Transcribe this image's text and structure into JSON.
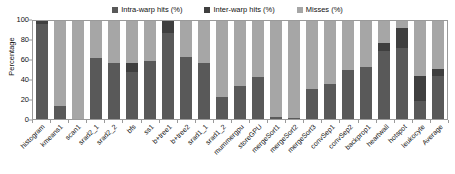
{
  "chart_data": {
    "type": "bar",
    "subtype": "stacked-column",
    "title": "",
    "xlabel": "",
    "ylabel": "Percentage",
    "ylim": [
      0,
      100
    ],
    "yticks": [
      0,
      20,
      40,
      60,
      80,
      100
    ],
    "grid": false,
    "legend_position": "top-center",
    "categories": [
      "histogram",
      "kmeans1",
      "scan1",
      "srad2_1",
      "srad2_2",
      "bfs",
      "ss1",
      "b+tree1",
      "b+tree2",
      "srad1_1",
      "srad1_2",
      "mummergpu",
      "storeGPU",
      "mergeSort1",
      "mergeSort2",
      "mergeSort3",
      "convSep1",
      "convSep2",
      "backprop1",
      "heartwall",
      "hotspot",
      "leukocyte",
      "Average"
    ],
    "series": [
      {
        "name": "Intra-warp hits (%)",
        "color": "#595959",
        "values": [
          97,
          13,
          0,
          62,
          57,
          48,
          59,
          88,
          63,
          57,
          22,
          34,
          43,
          2,
          1,
          31,
          36,
          50,
          53,
          69,
          72,
          18,
          44
        ]
      },
      {
        "name": "Inter-warp hits (%)",
        "color": "#3f3f3f",
        "values": [
          3,
          0,
          0,
          0,
          0,
          9,
          0,
          12,
          0,
          0,
          0,
          0,
          0,
          0,
          0,
          0,
          0,
          0,
          0,
          9,
          21,
          26,
          7
        ]
      },
      {
        "name": "Misses (%)",
        "color": "#a6a6a6",
        "values": [
          0,
          87,
          100,
          38,
          43,
          43,
          41,
          0,
          37,
          43,
          78,
          66,
          57,
          98,
          99,
          69,
          64,
          50,
          47,
          22,
          7,
          56,
          49
        ]
      }
    ]
  },
  "legend": {
    "items": [
      {
        "label": "Intra-warp hits (%)",
        "color": "#595959",
        "icon": "square-swatch"
      },
      {
        "label": "Inter-warp hits (%)",
        "color": "#3f3f3f",
        "icon": "square-swatch"
      },
      {
        "label": "Misses (%)",
        "color": "#a6a6a6",
        "icon": "square-swatch"
      }
    ]
  },
  "axes": {
    "y_title": "Percentage",
    "y_ticks": [
      "0",
      "20",
      "40",
      "60",
      "80",
      "100"
    ]
  }
}
